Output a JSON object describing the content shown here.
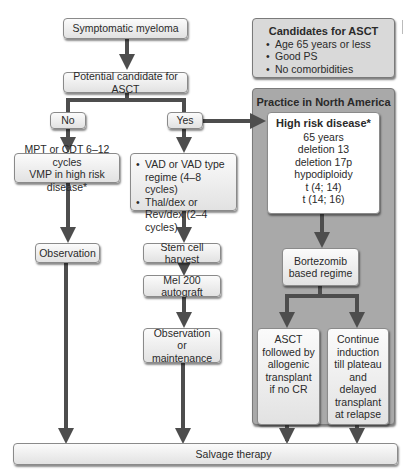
{
  "diagram": {
    "type": "flowchart",
    "topic": "Management of symptomatic myeloma",
    "colors": {
      "arrow": "#4d4d4d",
      "box_fill_top": "#fbfbfb",
      "box_fill_bottom": "#e2e2e2",
      "candidates_panel": "#d9d9d9",
      "practice_panel": "#a9a9a9",
      "high_risk_box": "#ffffff"
    },
    "nodes": {
      "start": "Symptomatic myeloma",
      "candidate": "Potential candidate for ASCT",
      "no": "No",
      "yes": "Yes",
      "no_treatment_line1": "MPT or CDT 6–12 cycles",
      "no_treatment_line2": "VMP in high risk disease*",
      "observation": "Observation",
      "yes_treatment": [
        "VAD or VAD type regime (4–8 cycles)",
        "Thal/dex or Rev/dex (2–4 cycles)"
      ],
      "stem_cell": "Stem cell harvest",
      "mel200": "Mel 200 autograft",
      "obs_maint": "Observation or maintenance",
      "salvage": "Salvage therapy"
    },
    "candidates": {
      "title": "Candidates for ASCT",
      "items": [
        "Age 65 years or less",
        "Good PS",
        "No comorbidities"
      ]
    },
    "practice": {
      "title": "Practice in North America",
      "high_risk": {
        "title": "High risk disease*",
        "items": [
          "65 years",
          "deletion 13",
          "deletion 17p",
          "hypodiploidy",
          "t (4; 14)",
          "t (14; 16)"
        ]
      },
      "bortezomib": "Bortezomib based regime",
      "asct_allo": "ASCT followed by allogenic transplant if no CR",
      "continue": "Continue induction till plateau and delayed transplant at relapse"
    }
  }
}
